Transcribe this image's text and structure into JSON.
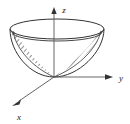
{
  "figure": {
    "background_color": "#ffffff",
    "stroke_color": "#333333",
    "hatch_color": "#404040"
  },
  "axes": [
    {
      "id": "z",
      "label": "z",
      "direction": "up",
      "arrow": true,
      "label_x": 64,
      "label_y": 13,
      "from": [
        54,
        77
      ],
      "to": [
        54,
        9
      ]
    },
    {
      "id": "y",
      "label": "y",
      "direction": "right",
      "arrow": true,
      "label_x": 120,
      "label_y": 81,
      "from": [
        54,
        77
      ],
      "to": [
        112,
        77
      ]
    },
    {
      "id": "x",
      "label": "x",
      "direction": "down-left",
      "arrow": true,
      "label_x": 19,
      "label_y": 120,
      "from": [
        54,
        77
      ],
      "to": [
        14,
        104
      ]
    }
  ],
  "surface": {
    "type": "paraboloid",
    "opening": "upward",
    "vertex": [
      54,
      77
    ],
    "rim_ellipse": {
      "center_x": 57,
      "center_y": 29,
      "radius_x": 47,
      "radius_y": 10
    },
    "inner_rim_ellipse": {
      "center_x": 57,
      "center_y": 33,
      "radius_x": 45,
      "radius_y": 9
    },
    "hatched": true,
    "hatch_spacing_px": 3,
    "hatch_angle_deg": 45
  },
  "icon_names": {
    "z_arrow": "arrow-up-icon",
    "y_arrow": "arrow-right-icon",
    "x_arrow": "arrow-down-left-icon"
  }
}
